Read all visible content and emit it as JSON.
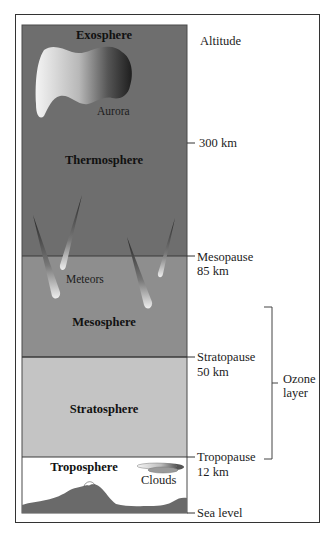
{
  "diagram": {
    "title_axis": "Altitude",
    "layers": [
      {
        "name": "Exosphere",
        "color": "#6e6e6e"
      },
      {
        "name": "Thermosphere",
        "color": "#6e6e6e"
      },
      {
        "name": "Mesosphere",
        "color": "#8e8e8e"
      },
      {
        "name": "Stratosphere",
        "color": "#c4c4c4"
      },
      {
        "name": "Troposphere",
        "color": "#ffffff"
      }
    ],
    "boundaries": [
      {
        "name": "300 km",
        "altitude": "300 km"
      },
      {
        "name": "Mesopause",
        "altitude": "85 km"
      },
      {
        "name": "Stratopause",
        "altitude": "50 km"
      },
      {
        "name": "Tropopause",
        "altitude": "12 km"
      },
      {
        "name": "Sea level",
        "altitude": ""
      }
    ],
    "features": {
      "aurora": "Aurora",
      "meteors": "Meteors",
      "clouds": "Clouds"
    },
    "bracket": {
      "line1": "Ozone",
      "line2": "layer"
    },
    "terrain_color": "#6a6a6a",
    "line_color": "#3a3a3a"
  }
}
